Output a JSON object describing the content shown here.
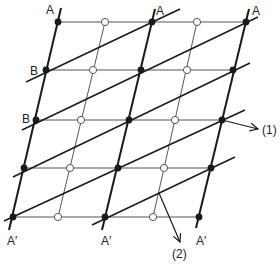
{
  "diagram": {
    "type": "lattice",
    "colors": {
      "ink": "#1a1a1a",
      "thin": "#555555",
      "background": "#ffffff"
    },
    "rows_y": [
      22,
      70,
      120,
      168,
      217
    ],
    "heavy_columns": [
      {
        "points": [
          [
            58,
            22
          ],
          [
            46,
            70
          ],
          [
            36,
            120
          ],
          [
            24,
            168
          ],
          [
            13,
            217
          ]
        ],
        "top": [
          61,
          8
        ],
        "bottom": [
          9,
          230
        ]
      },
      {
        "points": [
          [
            152,
            22
          ],
          [
            141,
            70
          ],
          [
            129,
            120
          ],
          [
            118,
            168
          ],
          [
            105,
            217
          ]
        ],
        "top": [
          155,
          9
        ],
        "bottom": [
          102,
          230
        ]
      },
      {
        "points": [
          [
            246,
            22
          ],
          [
            233,
            70
          ],
          [
            222,
            120
          ],
          [
            211,
            168
          ],
          [
            199,
            217
          ]
        ],
        "top": [
          249,
          9
        ],
        "bottom": [
          196,
          228
        ]
      }
    ],
    "thin_columns": [
      {
        "points": [
          [
            105,
            22
          ],
          [
            93,
            70
          ],
          [
            81,
            120
          ],
          [
            70,
            168
          ],
          [
            58,
            217
          ]
        ]
      },
      {
        "points": [
          [
            197,
            22
          ],
          [
            187,
            70
          ],
          [
            175,
            120
          ],
          [
            164,
            168
          ],
          [
            153,
            217
          ]
        ]
      }
    ],
    "diagonals": [
      {
        "from": [
          26,
          82
        ],
        "to": [
          180,
          9
        ]
      },
      {
        "from": [
          22,
          130
        ],
        "to": [
          258,
          17
        ]
      },
      {
        "from": [
          13,
          177
        ],
        "to": [
          250,
          63
        ]
      },
      {
        "from": [
          4,
          221
        ],
        "to": [
          245,
          110
        ]
      },
      {
        "from": [
          92,
          225
        ],
        "to": [
          235,
          157
        ]
      }
    ],
    "arrows": [
      {
        "id": "1",
        "from": [
          222,
          120
        ],
        "to": [
          258,
          129
        ],
        "label": "(1)",
        "label_pos": [
          262,
          134
        ]
      },
      {
        "id": "2",
        "from": [
          159,
          193
        ],
        "to": [
          180,
          242
        ],
        "label": "(2)",
        "label_pos": [
          172,
          258
        ]
      }
    ],
    "labels": [
      {
        "text": "A",
        "x": 46,
        "y": 14
      },
      {
        "text": "A",
        "x": 156,
        "y": 15
      },
      {
        "text": "A",
        "x": 252,
        "y": 15
      },
      {
        "text": "B",
        "x": 30,
        "y": 75
      },
      {
        "text": "B",
        "x": 22,
        "y": 123
      },
      {
        "text": "A′",
        "x": 7,
        "y": 245
      },
      {
        "text": "A′",
        "x": 101,
        "y": 245
      },
      {
        "text": "A′",
        "x": 196,
        "y": 245
      }
    ]
  }
}
